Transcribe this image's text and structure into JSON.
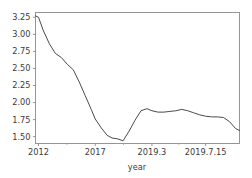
{
  "chart_data": {
    "type": "line",
    "title": "",
    "xlabel": "year",
    "ylabel": "",
    "grid": false,
    "legend": false,
    "ylim": [
      1.4,
      3.32
    ],
    "xlim": [
      0,
      41
    ],
    "ytick_values": [
      1.5,
      1.75,
      2.0,
      2.25,
      2.5,
      2.75,
      3.0,
      3.25
    ],
    "ytick_labels": [
      "1.50",
      "1.75",
      "2.00",
      "2.25",
      "2.50",
      "2.75",
      "3.00",
      "3.25"
    ],
    "xtick_positions": [
      0.6,
      12.0,
      23.4,
      34.2
    ],
    "xtick_labels": [
      "2012",
      "2017",
      "2019.3",
      "2019.7.15"
    ],
    "xtick_minor_positions": [
      6.3,
      17.7,
      28.8
    ],
    "line_color": "#4a4a4a",
    "series": [
      {
        "name": "rate",
        "x": [
          0.0,
          0.6,
          1.6,
          2.8,
          4.0,
          5.2,
          6.4,
          7.6,
          8.8,
          10.0,
          11.2,
          12.0,
          13.2,
          14.4,
          15.4,
          16.4,
          17.6,
          18.8,
          20.0,
          21.2,
          22.4,
          23.4,
          24.6,
          25.8,
          27.0,
          28.2,
          29.4,
          30.6,
          31.8,
          33.0,
          34.2,
          35.4,
          36.6,
          37.8,
          39.0,
          40.2,
          41.0
        ],
        "values": [
          3.27,
          3.25,
          3.05,
          2.86,
          2.72,
          2.66,
          2.56,
          2.48,
          2.3,
          2.1,
          1.9,
          1.76,
          1.63,
          1.52,
          1.48,
          1.47,
          1.44,
          1.58,
          1.74,
          1.88,
          1.91,
          1.88,
          1.86,
          1.86,
          1.87,
          1.88,
          1.9,
          1.88,
          1.85,
          1.82,
          1.8,
          1.79,
          1.79,
          1.78,
          1.72,
          1.62,
          1.59
        ]
      }
    ]
  },
  "axes": {
    "x_axis_name": "year",
    "y_axis_name": ""
  }
}
